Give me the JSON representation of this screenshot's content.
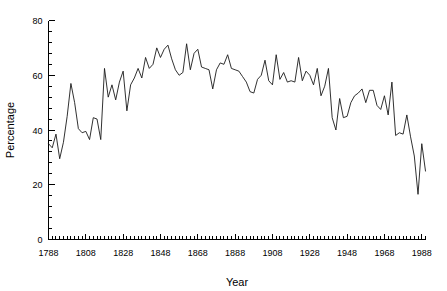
{
  "chart_data": {
    "type": "line",
    "title": "",
    "subtitle": "",
    "xlabel": "Year",
    "ylabel": "Percentage",
    "xlim": [
      1788,
      1990
    ],
    "ylim": [
      0,
      80
    ],
    "grid": false,
    "legend": null,
    "legend_position": "none",
    "x_ticks_major": [
      1788,
      1808,
      1828,
      1848,
      1868,
      1888,
      1908,
      1928,
      1948,
      1968,
      1988
    ],
    "x_tick_labels": [
      "1788",
      "1808",
      "1828",
      "1848",
      "1868",
      "1888",
      "1908",
      "1928",
      "1948",
      "1968",
      "1988"
    ],
    "x_tick_minor_step": 2,
    "y_ticks_major": [
      0,
      20,
      40,
      60,
      80
    ],
    "y_tick_labels": [
      "0",
      "20",
      "40",
      "60",
      "80"
    ],
    "y_tick_minor_step": 4,
    "line_color": "#1a1a1a",
    "x": [
      1788,
      1790,
      1792,
      1794,
      1796,
      1798,
      1800,
      1802,
      1804,
      1806,
      1808,
      1810,
      1812,
      1814,
      1816,
      1818,
      1820,
      1822,
      1824,
      1826,
      1828,
      1830,
      1832,
      1834,
      1836,
      1838,
      1840,
      1842,
      1844,
      1846,
      1848,
      1850,
      1852,
      1854,
      1856,
      1858,
      1860,
      1862,
      1864,
      1866,
      1868,
      1870,
      1872,
      1874,
      1876,
      1878,
      1880,
      1882,
      1884,
      1886,
      1888,
      1890,
      1892,
      1894,
      1896,
      1898,
      1900,
      1902,
      1904,
      1906,
      1908,
      1910,
      1912,
      1914,
      1916,
      1918,
      1920,
      1922,
      1924,
      1926,
      1928,
      1930,
      1932,
      1934,
      1936,
      1938,
      1940,
      1942,
      1944,
      1946,
      1948,
      1950,
      1952,
      1954,
      1956,
      1958,
      1960,
      1962,
      1964,
      1966,
      1968,
      1970,
      1972,
      1974,
      1976,
      1978,
      1980,
      1982,
      1984,
      1986,
      1988,
      1990
    ],
    "values": [
      35.0,
      33.5,
      38.5,
      29.5,
      35.5,
      45.0,
      57.0,
      50.0,
      40.5,
      39.0,
      39.5,
      36.5,
      44.5,
      44.0,
      36.5,
      62.5,
      52.0,
      56.5,
      51.0,
      57.5,
      61.5,
      47.0,
      56.5,
      59.0,
      62.5,
      59.0,
      66.5,
      62.5,
      64.0,
      70.0,
      66.5,
      69.5,
      71.0,
      66.0,
      62.0,
      60.0,
      61.0,
      71.5,
      62.0,
      68.0,
      69.5,
      63.0,
      62.5,
      62.0,
      55.0,
      62.0,
      64.5,
      64.0,
      67.5,
      62.5,
      62.0,
      61.5,
      59.5,
      57.5,
      54.0,
      53.5,
      58.5,
      60.0,
      65.5,
      58.0,
      56.5,
      67.5,
      58.5,
      61.0,
      57.5,
      58.0,
      57.5,
      66.5,
      58.0,
      61.5,
      60.0,
      56.5,
      62.5,
      52.5,
      56.0,
      62.5,
      44.5,
      40.0,
      51.5,
      44.5,
      45.0,
      50.0,
      52.5,
      53.5,
      55.0,
      50.0,
      54.5,
      54.5,
      49.0,
      47.5,
      52.5,
      45.5,
      57.5,
      38.0,
      39.0,
      38.5,
      45.5,
      37.5,
      30.5,
      16.5,
      35.0,
      25.0
    ]
  }
}
